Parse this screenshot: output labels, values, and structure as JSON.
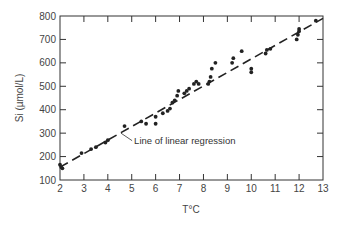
{
  "chart_data": {
    "type": "scatter",
    "title": "",
    "xlabel": "T°C",
    "ylabel": "Si (µmol/L)",
    "xlim": [
      2,
      13
    ],
    "ylim": [
      100,
      800
    ],
    "xticks": [
      2,
      3,
      4,
      5,
      6,
      7,
      8,
      9,
      10,
      11,
      12,
      13
    ],
    "yticks": [
      100,
      200,
      300,
      400,
      500,
      600,
      700,
      800
    ],
    "grid": false,
    "legend": null,
    "series": [
      {
        "name": "Observations",
        "marker": "filled-circle",
        "points": [
          [
            2.0,
            165
          ],
          [
            2.05,
            155
          ],
          [
            2.1,
            150
          ],
          [
            2.9,
            215
          ],
          [
            3.3,
            232
          ],
          [
            3.5,
            240
          ],
          [
            3.9,
            260
          ],
          [
            4.0,
            270
          ],
          [
            4.7,
            330
          ],
          [
            5.4,
            350
          ],
          [
            5.6,
            340
          ],
          [
            6.0,
            340
          ],
          [
            6.0,
            370
          ],
          [
            6.3,
            385
          ],
          [
            6.5,
            395
          ],
          [
            6.6,
            405
          ],
          [
            6.7,
            430
          ],
          [
            6.8,
            440
          ],
          [
            6.9,
            460
          ],
          [
            6.95,
            480
          ],
          [
            7.2,
            470
          ],
          [
            7.3,
            480
          ],
          [
            7.4,
            490
          ],
          [
            7.6,
            510
          ],
          [
            7.7,
            520
          ],
          [
            7.8,
            510
          ],
          [
            8.2,
            510
          ],
          [
            8.25,
            520
          ],
          [
            8.3,
            540
          ],
          [
            8.35,
            575
          ],
          [
            8.5,
            600
          ],
          [
            9.2,
            600
          ],
          [
            9.25,
            620
          ],
          [
            9.6,
            650
          ],
          [
            10.0,
            560
          ],
          [
            10.0,
            575
          ],
          [
            10.6,
            640
          ],
          [
            10.65,
            655
          ],
          [
            10.8,
            660
          ],
          [
            11.9,
            700
          ],
          [
            11.95,
            720
          ],
          [
            12.0,
            735
          ],
          [
            12.0,
            745
          ],
          [
            12.7,
            780
          ]
        ]
      },
      {
        "name": "Line of linear regression",
        "style": "dashed",
        "points": [
          [
            2.0,
            155
          ],
          [
            13.0,
            790
          ]
        ]
      }
    ],
    "annotations": [
      {
        "text": "Line of linear regression",
        "target": [
          4.55,
          300
        ],
        "text_position": [
          5.1,
          255
        ]
      }
    ]
  },
  "labels": {
    "xlabel": "T°C",
    "ylabel": "Si (µmol/L)",
    "annotation": "Line of linear regression"
  },
  "style": {
    "axis_color": "#333333",
    "point_color": "#222222",
    "line_color": "#222222",
    "background": "#ffffff"
  }
}
